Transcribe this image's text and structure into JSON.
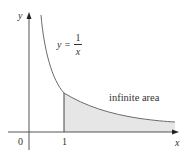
{
  "diagram": {
    "axes": {
      "x_label": "x",
      "y_label": "y",
      "origin_label": "0",
      "x_tick_label": "1"
    },
    "curve": {
      "equation_lhs": "y =",
      "numerator": "1",
      "denominator": "x"
    },
    "region_label": "infinite area",
    "colors": {
      "axis": "#555555",
      "curve": "#6b6b6b",
      "shade": "#e6e6e6"
    }
  }
}
